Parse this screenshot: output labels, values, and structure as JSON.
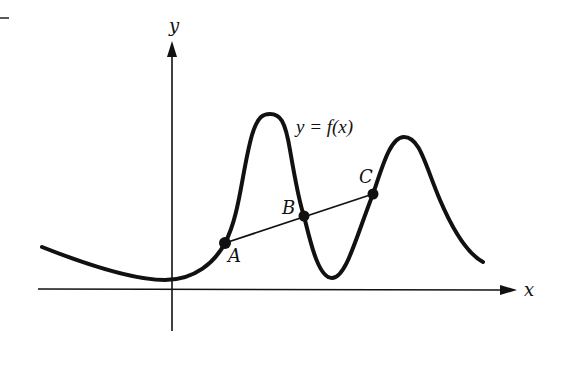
{
  "figure": {
    "axes": {
      "x_label": "x",
      "y_label": "y"
    },
    "curve_label": "y = f(x)",
    "points": [
      {
        "name": "A",
        "label": "A"
      },
      {
        "name": "B",
        "label": "B"
      },
      {
        "name": "C",
        "label": "C"
      }
    ],
    "secant_line": "A–B–C",
    "colors": {
      "stroke": "#111111",
      "background": "#ffffff"
    }
  }
}
